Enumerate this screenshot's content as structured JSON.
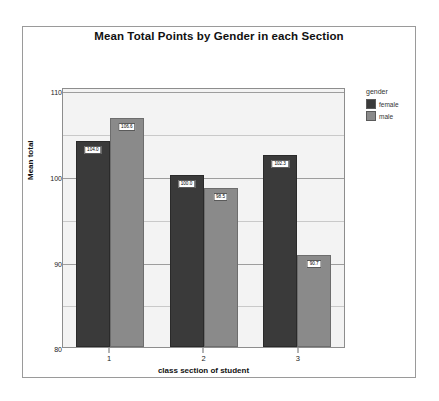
{
  "chart_data": {
    "type": "bar",
    "title": "Mean Total Points by Gender in each Section",
    "xlabel": "class section of student",
    "ylabel": "Mean total",
    "categories": [
      "1",
      "2",
      "3"
    ],
    "ylim": [
      80,
      110
    ],
    "yticks": [
      80,
      90,
      100,
      110
    ],
    "ytick_labels": [
      "80",
      "90",
      "100",
      "110"
    ],
    "grid": true,
    "legend_position": "right",
    "legend_title": "gender",
    "series": [
      {
        "name": "female",
        "color": "#3a3a3a",
        "values": [
          104.0,
          100.0,
          102.3
        ],
        "labels": [
          "104.0",
          "100.0",
          "102.3"
        ]
      },
      {
        "name": "male",
        "color": "#8a8a8a",
        "values": [
          106.6,
          98.5,
          90.7
        ],
        "labels": [
          "106.6",
          "98.5",
          "90.7"
        ]
      }
    ]
  },
  "colors": {
    "female": "#3a3a3a",
    "male": "#8a8a8a",
    "plot_background": "#f3f3f3",
    "gridline": "#9d9d9d",
    "frame": "#9a9a9a"
  }
}
